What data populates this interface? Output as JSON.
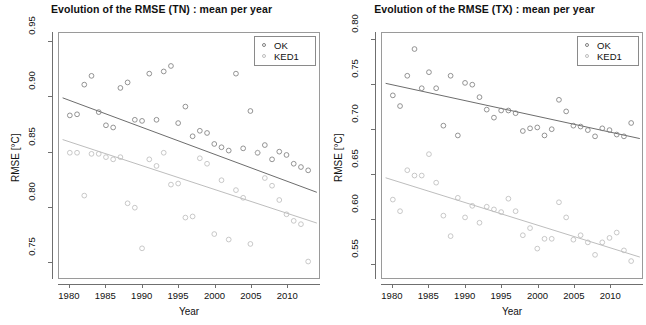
{
  "figure": {
    "width": 646,
    "height": 325,
    "background": "#ffffff"
  },
  "series_colors": {
    "OK": "#808080",
    "KED1": "#bdbdbd"
  },
  "panels": [
    {
      "id": "tn",
      "title": "Evolution of the RMSE (TN) : mean per year",
      "xlabel": "Year",
      "ylabel": "RMSE [°C]",
      "legend": {
        "position": "top-right",
        "items": [
          "OK",
          "KED1"
        ]
      }
    },
    {
      "id": "tx",
      "title": "Evolution of the RMSE (TX) : mean per year",
      "xlabel": "Year",
      "ylabel": "RMSE [°C]",
      "legend": {
        "position": "top-right",
        "items": [
          "OK",
          "KED1"
        ]
      }
    }
  ],
  "chart_data": [
    {
      "type": "scatter",
      "id": "tn",
      "title": "Evolution of the RMSE (TN) : mean per year",
      "xlabel": "Year",
      "ylabel": "RMSE [°C]",
      "xlim": [
        1978.5,
        2014.5
      ],
      "ylim": [
        0.735,
        0.958
      ],
      "xticks": [
        1980,
        1985,
        1990,
        1995,
        2000,
        2005,
        2010
      ],
      "yticks": [
        0.75,
        0.8,
        0.85,
        0.9,
        0.95
      ],
      "grid": false,
      "legend": [
        "OK",
        "KED1"
      ],
      "legend_position": "top right",
      "series": [
        {
          "name": "OK",
          "color": "#808080",
          "marker": "open-circle",
          "x": [
            1980,
            1981,
            1982,
            1983,
            1984,
            1985,
            1986,
            1987,
            1988,
            1989,
            1990,
            1991,
            1992,
            1993,
            1994,
            1995,
            1996,
            1997,
            1998,
            1999,
            2000,
            2001,
            2002,
            2003,
            2004,
            2005,
            2006,
            2007,
            2008,
            2009,
            2010,
            2011,
            2012,
            2013
          ],
          "y": [
            0.883,
            0.884,
            0.911,
            0.919,
            0.886,
            0.874,
            0.872,
            0.908,
            0.913,
            0.879,
            0.878,
            0.921,
            0.879,
            0.923,
            0.928,
            0.876,
            0.891,
            0.864,
            0.869,
            0.867,
            0.857,
            0.854,
            0.851,
            0.921,
            0.853,
            0.887,
            0.849,
            0.856,
            0.843,
            0.85,
            0.847,
            0.839,
            0.836,
            0.833
          ]
        },
        {
          "name": "KED1",
          "color": "#bdbdbd",
          "marker": "open-circle",
          "x": [
            1980,
            1981,
            1982,
            1983,
            1984,
            1985,
            1986,
            1987,
            1988,
            1989,
            1990,
            1991,
            1992,
            1993,
            1994,
            1995,
            1996,
            1997,
            1998,
            1999,
            2000,
            2001,
            2002,
            2003,
            2004,
            2005,
            2006,
            2007,
            2008,
            2009,
            2010,
            2011,
            2012,
            2013
          ],
          "y": [
            0.849,
            0.849,
            0.81,
            0.848,
            0.848,
            0.845,
            0.843,
            0.845,
            0.803,
            0.799,
            0.762,
            0.843,
            0.837,
            0.849,
            0.82,
            0.821,
            0.79,
            0.791,
            0.844,
            0.839,
            0.775,
            0.824,
            0.77,
            0.815,
            0.808,
            0.766,
            0.849,
            0.826,
            0.819,
            0.806,
            0.793,
            0.787,
            0.784,
            0.75
          ]
        }
      ],
      "trend_lines": [
        {
          "name": "OK",
          "color": "#5a5a5a",
          "x": [
            1979.0,
            2014.2
          ],
          "y": [
            0.899,
            0.813
          ]
        },
        {
          "name": "KED1",
          "color": "#b5b5b5",
          "x": [
            1979.0,
            2014.2
          ],
          "y": [
            0.861,
            0.785
          ]
        }
      ]
    },
    {
      "type": "scatter",
      "id": "tx",
      "title": "Evolution of the RMSE (TX) : mean per year",
      "xlabel": "Year",
      "ylabel": "RMSE [°C]",
      "xlim": [
        1978.5,
        2014.5
      ],
      "ylim": [
        0.533,
        0.808
      ],
      "xticks": [
        1980,
        1985,
        1990,
        1995,
        2000,
        2005,
        2010
      ],
      "yticks": [
        0.55,
        0.6,
        0.65,
        0.7,
        0.75,
        0.8
      ],
      "grid": false,
      "legend": [
        "OK",
        "KED1"
      ],
      "legend_position": "top right",
      "series": [
        {
          "name": "OK",
          "color": "#808080",
          "marker": "open-circle",
          "x": [
            1980,
            1981,
            1982,
            1983,
            1984,
            1985,
            1986,
            1987,
            1988,
            1989,
            1990,
            1991,
            1992,
            1993,
            1994,
            1995,
            1996,
            1997,
            1998,
            1999,
            2000,
            2001,
            2002,
            2003,
            2004,
            2005,
            2006,
            2007,
            2008,
            2009,
            2010,
            2011,
            2012,
            2013
          ],
          "y": [
            0.738,
            0.726,
            0.76,
            0.79,
            0.746,
            0.764,
            0.746,
            0.704,
            0.76,
            0.693,
            0.752,
            0.75,
            0.736,
            0.722,
            0.713,
            0.721,
            0.721,
            0.718,
            0.698,
            0.701,
            0.702,
            0.693,
            0.7,
            0.733,
            0.72,
            0.704,
            0.703,
            0.699,
            0.692,
            0.701,
            0.699,
            0.694,
            0.692,
            0.707
          ]
        },
        {
          "name": "KED1",
          "color": "#bdbdbd",
          "marker": "open-circle",
          "x": [
            1980,
            1981,
            1982,
            1983,
            1984,
            1985,
            1986,
            1987,
            1988,
            1989,
            1990,
            1991,
            1992,
            1993,
            1994,
            1995,
            1996,
            1997,
            1998,
            1999,
            2000,
            2001,
            2002,
            2003,
            2004,
            2005,
            2006,
            2007,
            2008,
            2009,
            2010,
            2011,
            2012,
            2013
          ],
          "y": [
            0.621,
            0.608,
            0.654,
            0.648,
            0.648,
            0.672,
            0.64,
            0.603,
            0.58,
            0.623,
            0.601,
            0.614,
            0.595,
            0.613,
            0.61,
            0.607,
            0.622,
            0.608,
            0.581,
            0.589,
            0.566,
            0.577,
            0.577,
            0.618,
            0.601,
            0.576,
            0.581,
            0.573,
            0.559,
            0.573,
            0.578,
            0.584,
            0.564,
            0.552
          ]
        }
      ],
      "trend_lines": [
        {
          "name": "OK",
          "color": "#5a5a5a",
          "x": [
            1979.0,
            2014.2
          ],
          "y": [
            0.7515,
            0.6895
          ]
        },
        {
          "name": "KED1",
          "color": "#b5b5b5",
          "x": [
            1979.0,
            2014.2
          ],
          "y": [
            0.6455,
            0.5565
          ]
        }
      ]
    }
  ]
}
